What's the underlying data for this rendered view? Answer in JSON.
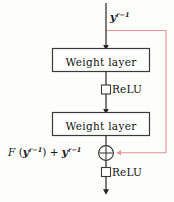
{
  "diagram": {
    "type": "residual-block-flowchart",
    "background_color": "#fdfdfc",
    "line_color": "#262626",
    "skip_color": "#e8938f",
    "text_color": "#111111",
    "input_label": {
      "plain": "y^{r-1}",
      "base": "y",
      "exponent": "r−1"
    },
    "blocks": [
      {
        "id": "weight-layer-1",
        "label": "Weight layer",
        "x": 52,
        "y": 48,
        "w": 98,
        "h": 24
      },
      {
        "id": "weight-layer-2",
        "label": "Weight layer",
        "x": 52,
        "y": 112,
        "w": 98,
        "h": 24
      }
    ],
    "activations": [
      {
        "id": "relu-1",
        "label": "ReLU",
        "marker": "square-node"
      },
      {
        "id": "relu-2",
        "label": "ReLU",
        "marker": "square-node"
      }
    ],
    "sum_node": {
      "id": "add-node",
      "glyph": "⊕",
      "operation": "element-wise addition",
      "cx": 106,
      "cy": 153,
      "r": 7.5
    },
    "sum_label": {
      "plain": "F (y^{r-1}) + y^{r-1}",
      "fn": "F",
      "open": " (",
      "arg_base": "y",
      "arg_exponent": "r−1",
      "close": ")",
      "plus": " + ",
      "term_base": "y",
      "term_exponent": "r−1"
    },
    "skip_connection": {
      "name": "identity-shortcut",
      "from": "input-stem",
      "to": "add-node",
      "color": "#e8938f"
    }
  }
}
